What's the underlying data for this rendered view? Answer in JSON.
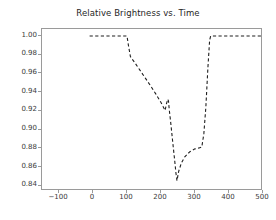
{
  "chart_data": {
    "type": "line",
    "title": "Relative Brightness vs. Time",
    "xlabel": "",
    "ylabel": "",
    "xlim": [
      -150,
      500
    ],
    "ylim": [
      0.8345,
      1.0075
    ],
    "xticks": [
      -100,
      0,
      100,
      200,
      300,
      400,
      500
    ],
    "xticklabels": [
      "−100",
      "0",
      "100",
      "200",
      "300",
      "400",
      "500"
    ],
    "yticks": [
      0.84,
      0.86,
      0.88,
      0.9,
      0.92,
      0.94,
      0.96,
      0.98,
      1.0
    ],
    "yticklabels": [
      "0.84",
      "0.86",
      "0.88",
      "0.90",
      "0.92",
      "0.94",
      "0.96",
      "0.98",
      "1.00"
    ],
    "grid": false,
    "legend": null,
    "line_style": "dashed",
    "line_color": "#1f1f1f",
    "line_width": 1.1,
    "series": [
      {
        "name": "Relative Brightness",
        "x": [
          -10,
          20,
          50,
          80,
          100,
          104,
          110,
          125,
          140,
          155,
          170,
          185,
          200,
          212,
          216,
          220,
          222,
          224,
          228,
          232,
          236,
          240,
          244,
          247,
          252,
          260,
          270,
          285,
          300,
          312,
          320,
          326,
          332,
          338,
          343,
          346,
          360,
          390,
          420,
          450,
          480,
          500
        ],
        "y": [
          1.0,
          1.0,
          1.0,
          1.0,
          1.0,
          0.9905,
          0.978,
          0.9705,
          0.9625,
          0.9545,
          0.9465,
          0.938,
          0.929,
          0.9205,
          0.9275,
          0.9325,
          0.9305,
          0.9225,
          0.9095,
          0.8955,
          0.8815,
          0.868,
          0.8535,
          0.8455,
          0.8555,
          0.8645,
          0.871,
          0.8765,
          0.8795,
          0.8805,
          0.8815,
          0.8955,
          0.9245,
          0.9665,
          0.9955,
          1.0,
          1.0,
          1.0,
          1.0,
          1.0,
          1.0,
          1.0
        ]
      }
    ]
  },
  "figure": {
    "background_color": "#ffffff",
    "axes_edge_color": "#9a9a9a",
    "tick_color": "#3a3a3a"
  }
}
